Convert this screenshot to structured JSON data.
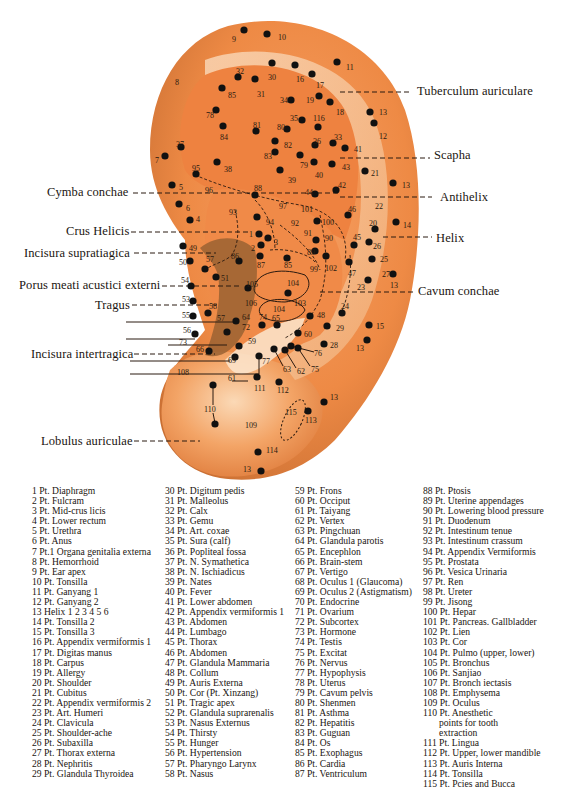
{
  "diagram": {
    "title_subject": "Auricular acupuncture points",
    "colors": {
      "ear_base": "#f0904a",
      "ear_light": "#f6c79a",
      "ear_shadow": "#b8713a",
      "concha_dark": "#8a5a2a",
      "point": "#111111",
      "background": "#ffffff"
    },
    "region_labels": {
      "tuberculum": "Tuberculum auriculare",
      "scapha": "Scapha",
      "cymba": "Cymba conchae",
      "antihelix": "Antihelix",
      "crus_helicis": "Crus Helicis",
      "helix": "Helix",
      "incisura_supra": "Incisura supratiagica",
      "porus": "Porus meati acustici externi",
      "cavum": "Cavum conchae",
      "tragus": "Tragus",
      "incisura_inter": "Incisura intertragica",
      "lobulus": "Lobulus auriculae"
    }
  },
  "legend": {
    "col1": [
      "1 Pt. Diaphragm",
      "2 Pt. Fulcram",
      "3 Pt. Mid-crus licis",
      "4 Pt. Lower rectum",
      "5 Pt. Urethra",
      "6 Pt. Anus",
      "7 Pt.1 Organa genitalia externa",
      "8 Pt. Hemorrhoid",
      "9 Pt. Ear apex",
      "10 Pt. Tonsilla",
      "11 Pt. Ganyang 1",
      "12 Pt. Ganyang 2",
      "13 Helix 1 2 3 4 5 6",
      "14 Pt. Tonsilla 2",
      "15 Pt. Tonsilla 3",
      "16 Pt. Appendix vermiformis 1",
      "17 Pt. Digitas manus",
      "18 Pt. Carpus",
      "19 Pt. Allergy",
      "20 Pt. Shoulder",
      "21 Pt. Cubitus",
      "22 Pt. Appendix vermiformis 2",
      "23 Pt. Art. Humeri",
      "24 Pt. Clavicula",
      "25 Pt. Shoulder-ache",
      "26 Pt. Subaxilla",
      "27 Pt. Thorax externa",
      "28 Pt. Nephritis",
      "29 Pt. Glandula Thyroidea"
    ],
    "col2": [
      "30 Pt. Digitum pedis",
      "31 Pt. Malleolus",
      "32 Pt. Calx",
      "33 Pt. Gemu",
      "34 Pt. Art. coxae",
      "35 Pt. Sura (calf)",
      "36 Pt. Popliteal fossa",
      "37 Pt. N. Symathetica",
      "38 Pt. N. Ischiadicus",
      "39 Pt. Nates",
      "40 Pt. Fever",
      "41 Pt. Lower abdomen",
      "42 Pt. Appendix vermiformis 1",
      "43 Pt. Abdomen",
      "44 Pt. Lumbago",
      "45 Pt. Thorax",
      "46 Pt. Abdomen",
      "47 Pt. Glandula Mammaria",
      "48 Pt. Collum",
      "49 Pt. Auris Externa",
      "50 Pt. Cor (Pt. Xinzang)",
      "51 Pt. Tragic apex",
      "52 Pt. Glandula suprarenalis",
      "53 Pt. Nasus Externus",
      "54 Pt. Thirsty",
      "55 Pt. Hunger",
      "56 Pt. Hypertension",
      "57 Pt. Pharyngo Larynx",
      "58 Pt. Nasus"
    ],
    "col3": [
      "59 Pt. Frons",
      "60 Pt. Occiput",
      "61 Pt. Taiyang",
      "62 Pt. Vertex",
      "63 Pt. Pingchuan",
      "64 Pt. Glandula parotis",
      "65 Pt. Encephlon",
      "66 Pt. Brain-stem",
      "67 Pt. Vertigo",
      "68 Pt. Oculus 1 (Glaucoma)",
      "69 Pt. Oculus 2 (Astigmatism)",
      "70 Pt. Endocrine",
      "71 Pt. Ovarium",
      "72 Pt. Subcortex",
      "73 Pt. Hormone",
      "74 Pt. Testis",
      "75 Pt. Excitat",
      "76 Pt. Nervus",
      "77 Pt. Hypophysis",
      "78 Pt. Uterus",
      "79 Pt. Cavum pelvis",
      "80 Pt. Shenmen",
      "81 Pt. Asthma",
      "82 Pt. Hepatitis",
      "83 Pt. Guguan",
      "84 Pt. Os",
      "85 Pt. Exophagus",
      "86 Pt. Cardia",
      "87 Pt. Ventriculum"
    ],
    "col4": [
      "88 Pt. Ptosis",
      "89 Pt. Uterine appendages",
      "90 Pt. Lowering blood pressure",
      "91 Pt. Duodenum",
      "92 Pt. Intestinum tenue",
      "93 Pt. Intestinum crassum",
      "94 Pt. Appendix Vermiformis",
      "95 Pt. Prostata",
      "96 Pt. Vesica Urinaria",
      "97 Pt. Ren",
      "98 Pt. Ureter",
      "99 Pt. Jisong",
      "100 Pt. Hepar",
      "101 Pt. Pancreas. Gallbladder",
      "102 Pt. Lien",
      "103 Pt. Cor",
      "104 Pt. Pulmo (upper, lower)",
      "105 Pt. Bronchus",
      "106 Pt. Sanjiao",
      "107 Pt. Bronch iectasis",
      "108 Pt. Emphysema",
      "109 Pt. Oculus",
      "110 Pt. Anesthetic",
      "points for tooth",
      "extraction",
      "111 Pt. Lingua",
      "112 Pt. Upper, lower mandible",
      "113 Pt. Auris Interna",
      "114 Pt. Tonsilla",
      "115 Pt. Pcies and Bucca"
    ]
  },
  "points": [
    {
      "n": "9",
      "x": 244,
      "y": 30,
      "lx": 232,
      "ly": 42
    },
    {
      "n": "10",
      "x": 267,
      "y": 34,
      "lx": 278,
      "ly": 40
    },
    {
      "n": "8",
      "x": 0,
      "y": 0,
      "lx": 175,
      "ly": 85
    },
    {
      "n": "11",
      "x": 337,
      "y": 62,
      "lx": 346,
      "ly": 70
    },
    {
      "n": "30",
      "x": 272,
      "y": 63,
      "lx": 268,
      "ly": 80
    },
    {
      "n": "32",
      "x": 238,
      "y": 77,
      "lx": 236,
      "ly": 74
    },
    {
      "n": "16",
      "x": 295,
      "y": 65,
      "lx": 296,
      "ly": 82
    },
    {
      "n": "17",
      "x": 312,
      "y": 74,
      "lx": 316,
      "ly": 88
    },
    {
      "n": "31",
      "x": 255,
      "y": 79,
      "lx": 257,
      "ly": 97
    },
    {
      "n": "85",
      "x": 222,
      "y": 88,
      "lx": 228,
      "ly": 98
    },
    {
      "n": "34",
      "x": 291,
      "y": 100,
      "lx": 280,
      "ly": 103
    },
    {
      "n": "19",
      "x": 319,
      "y": 96,
      "lx": 306,
      "ly": 103
    },
    {
      "n": "18",
      "x": 330,
      "y": 102,
      "lx": 336,
      "ly": 115
    },
    {
      "n": "78",
      "x": 216,
      "y": 110,
      "lx": 206,
      "ly": 118
    },
    {
      "n": "13",
      "x": 370,
      "y": 112,
      "lx": 379,
      "ly": 115
    },
    {
      "n": "116",
      "x": 318,
      "y": 127,
      "lx": 313,
      "ly": 121
    },
    {
      "n": "35",
      "x": 302,
      "y": 120,
      "lx": 290,
      "ly": 121
    },
    {
      "n": "12",
      "x": 374,
      "y": 123,
      "lx": 379,
      "ly": 139
    },
    {
      "n": "81",
      "x": 256,
      "y": 131,
      "lx": 253,
      "ly": 128
    },
    {
      "n": "80",
      "x": 287,
      "y": 129,
      "lx": 277,
      "ly": 130
    },
    {
      "n": "84",
      "x": 223,
      "y": 126,
      "lx": 220,
      "ly": 140
    },
    {
      "n": "82",
      "x": 275,
      "y": 141,
      "lx": 284,
      "ly": 148
    },
    {
      "n": "36",
      "x": 315,
      "y": 145,
      "lx": 313,
      "ly": 144
    },
    {
      "n": "33",
      "x": 333,
      "y": 143,
      "lx": 334,
      "ly": 140
    },
    {
      "n": "41",
      "x": 345,
      "y": 148,
      "lx": 354,
      "ly": 152
    },
    {
      "n": "37",
      "x": 181,
      "y": 147,
      "lx": 176,
      "ly": 147
    },
    {
      "n": "7",
      "x": 165,
      "y": 156,
      "lx": 155,
      "ly": 163
    },
    {
      "n": "83",
      "x": 275,
      "y": 152,
      "lx": 264,
      "ly": 159
    },
    {
      "n": "79",
      "x": 300,
      "y": 155,
      "lx": 300,
      "ly": 168
    },
    {
      "n": "40",
      "x": 314,
      "y": 162,
      "lx": 315,
      "ly": 178
    },
    {
      "n": "43",
      "x": 332,
      "y": 164,
      "lx": 342,
      "ly": 170
    },
    {
      "n": "38",
      "x": 217,
      "y": 162,
      "lx": 224,
      "ly": 172
    },
    {
      "n": "39",
      "x": 280,
      "y": 170,
      "lx": 288,
      "ly": 183
    },
    {
      "n": "21",
      "x": 365,
      "y": 171,
      "lx": 371,
      "ly": 176
    },
    {
      "n": "95",
      "x": 196,
      "y": 174,
      "lx": 192,
      "ly": 171
    },
    {
      "n": "5",
      "x": 172,
      "y": 185,
      "lx": 179,
      "ly": 190
    },
    {
      "n": "96",
      "x": 0,
      "y": 0,
      "lx": 205,
      "ly": 193
    },
    {
      "n": "88",
      "x": 255,
      "y": 195,
      "lx": 254,
      "ly": 191
    },
    {
      "n": "44",
      "x": 315,
      "y": 194,
      "lx": 305,
      "ly": 195
    },
    {
      "n": "42",
      "x": 336,
      "y": 190,
      "lx": 338,
      "ly": 188
    },
    {
      "n": "13",
      "x": 393,
      "y": 183,
      "lx": 402,
      "ly": 188
    },
    {
      "n": "6",
      "x": 179,
      "y": 204,
      "lx": 186,
      "ly": 211
    },
    {
      "n": "97",
      "x": 0,
      "y": 0,
      "lx": 279,
      "ly": 209
    },
    {
      "n": "101",
      "x": 0,
      "y": 0,
      "lx": 301,
      "ly": 212
    },
    {
      "n": "22",
      "x": 0,
      "y": 0,
      "lx": 375,
      "ly": 209
    },
    {
      "n": "46",
      "x": 348,
      "y": 215,
      "lx": 348,
      "ly": 212
    },
    {
      "n": "93",
      "x": 0,
      "y": 0,
      "lx": 229,
      "ly": 215
    },
    {
      "n": "4",
      "x": 190,
      "y": 220,
      "lx": 196,
      "ly": 222
    },
    {
      "n": "94",
      "x": 257,
      "y": 217,
      "lx": 266,
      "ly": 225
    },
    {
      "n": "92",
      "x": 0,
      "y": 0,
      "lx": 291,
      "ly": 226
    },
    {
      "n": "100",
      "x": 317,
      "y": 221,
      "lx": 322,
      "ly": 225
    },
    {
      "n": "20",
      "x": 375,
      "y": 229,
      "lx": 369,
      "ly": 226
    },
    {
      "n": "14",
      "x": 396,
      "y": 222,
      "lx": 403,
      "ly": 228
    },
    {
      "n": "91",
      "x": 0,
      "y": 0,
      "lx": 304,
      "ly": 236
    },
    {
      "n": "1",
      "x": 259,
      "y": 234,
      "lx": 249,
      "ly": 237
    },
    {
      "n": "3",
      "x": 268,
      "y": 238,
      "lx": 274,
      "ly": 245
    },
    {
      "n": "90",
      "x": 316,
      "y": 240,
      "lx": 325,
      "ly": 241
    },
    {
      "n": "45",
      "x": 354,
      "y": 245,
      "lx": 353,
      "ly": 240
    },
    {
      "n": "26",
      "x": 369,
      "y": 242,
      "lx": 373,
      "ly": 249
    },
    {
      "n": "2",
      "x": 261,
      "y": 245,
      "lx": 251,
      "ly": 251
    },
    {
      "n": "49",
      "x": 183,
      "y": 246,
      "lx": 189,
      "ly": 251
    },
    {
      "n": "89",
      "x": 315,
      "y": 251,
      "lx": 307,
      "ly": 255
    },
    {
      "n": "86",
      "x": 239,
      "y": 261,
      "lx": 231,
      "ly": 259
    },
    {
      "n": "57",
      "x": 205,
      "y": 269,
      "lx": 206,
      "ly": 262
    },
    {
      "n": "50",
      "x": 190,
      "y": 261,
      "lx": 179,
      "ly": 265
    },
    {
      "n": "87",
      "x": 260,
      "y": 256,
      "lx": 257,
      "ly": 268
    },
    {
      "n": "85",
      "x": 287,
      "y": 258,
      "lx": 284,
      "ly": 268
    },
    {
      "n": "99",
      "x": 0,
      "y": 0,
      "lx": 310,
      "ly": 272
    },
    {
      "n": "102",
      "x": 326,
      "y": 256,
      "lx": 325,
      "ly": 271
    },
    {
      "n": "47",
      "x": 349,
      "y": 262,
      "lx": 348,
      "ly": 276
    },
    {
      "n": "25",
      "x": 372,
      "y": 259,
      "lx": 380,
      "ly": 262
    },
    {
      "n": "27",
      "x": 393,
      "y": 274,
      "lx": 382,
      "ly": 277
    },
    {
      "n": "51",
      "x": 216,
      "y": 277,
      "lx": 221,
      "ly": 281
    },
    {
      "n": "54",
      "x": 191,
      "y": 286,
      "lx": 181,
      "ly": 283
    },
    {
      "n": "104",
      "x": 0,
      "y": 0,
      "lx": 287,
      "ly": 286
    },
    {
      "n": "105",
      "x": 248,
      "y": 288,
      "lx": 246,
      "ly": 287
    },
    {
      "n": "13",
      "x": 0,
      "y": 0,
      "lx": 390,
      "ly": 288
    },
    {
      "n": "23",
      "x": 368,
      "y": 280,
      "lx": 357,
      "ly": 290
    },
    {
      "n": "104",
      "x": 288,
      "y": 293,
      "lx": 0,
      "ly": 0
    },
    {
      "n": "103",
      "x": 0,
      "y": 0,
      "lx": 294,
      "ly": 306
    },
    {
      "n": "53",
      "x": 193,
      "y": 301,
      "lx": 182,
      "ly": 302
    },
    {
      "n": "106",
      "x": 0,
      "y": 0,
      "lx": 245,
      "ly": 306
    },
    {
      "n": "104",
      "x": 0,
      "y": 0,
      "lx": 273,
      "ly": 312
    },
    {
      "n": "58",
      "x": 208,
      "y": 313,
      "lx": 209,
      "ly": 309
    },
    {
      "n": "24",
      "x": 342,
      "y": 313,
      "lx": 341,
      "ly": 309
    },
    {
      "n": "55",
      "x": 193,
      "y": 316,
      "lx": 182,
      "ly": 318
    },
    {
      "n": "57",
      "x": 0,
      "y": 0,
      "lx": 217,
      "ly": 321
    },
    {
      "n": "64",
      "x": 236,
      "y": 321,
      "lx": 242,
      "ly": 320
    },
    {
      "n": "74",
      "x": 262,
      "y": 325,
      "lx": 259,
      "ly": 320
    },
    {
      "n": "65",
      "x": 277,
      "y": 325,
      "lx": 272,
      "ly": 321
    },
    {
      "n": "48",
      "x": 310,
      "y": 316,
      "lx": 317,
      "ly": 318
    },
    {
      "n": "15",
      "x": 369,
      "y": 325,
      "lx": 376,
      "ly": 329
    },
    {
      "n": "29",
      "x": 327,
      "y": 326,
      "lx": 336,
      "ly": 331
    },
    {
      "n": "72",
      "x": 227,
      "y": 332,
      "lx": 242,
      "ly": 330
    },
    {
      "n": "60",
      "x": 298,
      "y": 333,
      "lx": 304,
      "ly": 337
    },
    {
      "n": "56",
      "x": 195,
      "y": 334,
      "lx": 183,
      "ly": 333
    },
    {
      "n": "28",
      "x": 324,
      "y": 344,
      "lx": 330,
      "ly": 348
    },
    {
      "n": "13",
      "x": 367,
      "y": 340,
      "lx": 356,
      "ly": 351
    },
    {
      "n": "73",
      "x": 0,
      "y": 0,
      "lx": 179,
      "ly": 345
    },
    {
      "n": "59",
      "x": 239,
      "y": 346,
      "lx": 248,
      "ly": 344
    },
    {
      "n": "66",
      "x": 209,
      "y": 351,
      "lx": 196,
      "ly": 352
    },
    {
      "n": "76",
      "x": 291,
      "y": 346,
      "lx": 314,
      "ly": 356
    },
    {
      "n": "69",
      "x": 235,
      "y": 357,
      "lx": 228,
      "ly": 363
    },
    {
      "n": "77",
      "x": 259,
      "y": 356,
      "lx": 262,
      "ly": 364
    },
    {
      "n": "63",
      "x": 274,
      "y": 349,
      "lx": 283,
      "ly": 372
    },
    {
      "n": "62",
      "x": 285,
      "y": 350,
      "lx": 297,
      "ly": 374
    },
    {
      "n": "75",
      "x": 298,
      "y": 348,
      "lx": 311,
      "ly": 372
    },
    {
      "n": "108",
      "x": 0,
      "y": 0,
      "lx": 177,
      "ly": 375
    },
    {
      "n": "61",
      "x": 0,
      "y": 0,
      "lx": 228,
      "ly": 381
    },
    {
      "n": "111",
      "x": 257,
      "y": 377,
      "lx": 254,
      "ly": 391
    },
    {
      "n": "112",
      "x": 279,
      "y": 382,
      "lx": 277,
      "ly": 393
    },
    {
      "n": "110",
      "x": 213,
      "y": 385,
      "lx": 204,
      "ly": 412
    },
    {
      "n": "110b",
      "x": 215,
      "y": 424,
      "lx": 0,
      "ly": 0
    },
    {
      "n": "13",
      "x": 324,
      "y": 402,
      "lx": 330,
      "ly": 400
    },
    {
      "n": "113",
      "x": 308,
      "y": 411,
      "lx": 305,
      "ly": 423
    },
    {
      "n": "115",
      "x": 0,
      "y": 0,
      "lx": 285,
      "ly": 415
    },
    {
      "n": "109",
      "x": 0,
      "y": 0,
      "lx": 245,
      "ly": 428
    },
    {
      "n": "114",
      "x": 258,
      "y": 452,
      "lx": 266,
      "ly": 453
    },
    {
      "n": "13",
      "x": 261,
      "y": 471,
      "lx": 243,
      "ly": 472
    }
  ]
}
